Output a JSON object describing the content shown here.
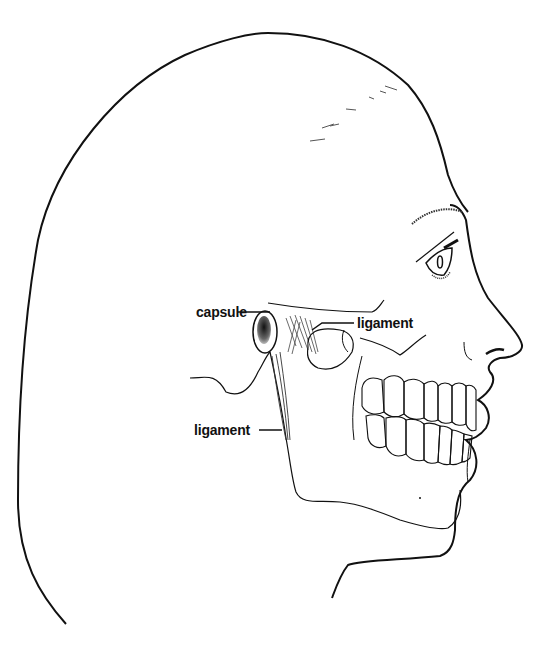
{
  "figure": {
    "style": "black line drawing on white background",
    "colors": {
      "line": "#111111",
      "background": "#ffffff",
      "condyle_shading": "#555555"
    }
  },
  "labels": [
    {
      "id": "capsule",
      "text": "capsule"
    },
    {
      "id": "ligament_upper",
      "text": "ligament"
    },
    {
      "id": "ligament_lower",
      "text": "ligament"
    }
  ]
}
